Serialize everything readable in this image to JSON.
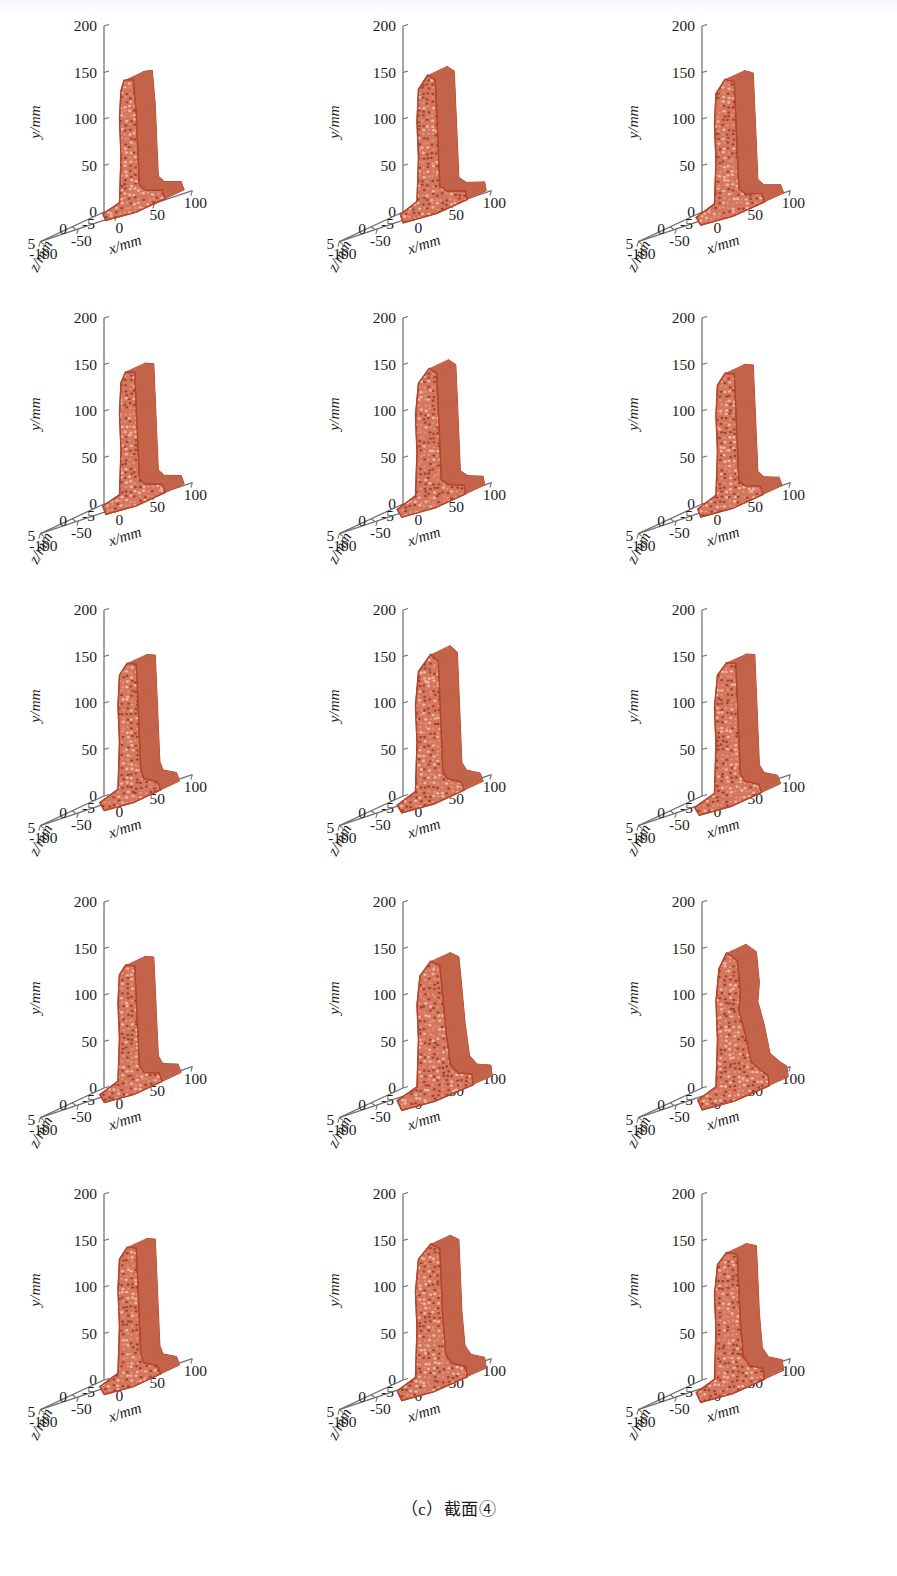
{
  "figure": {
    "caption": "（c）截面④",
    "caption_label": "(c)",
    "caption_text": "截面④",
    "rows": 5,
    "cols": 3,
    "panel_count": 15
  },
  "axes": {
    "y": {
      "label": "y/mm",
      "ticks": [
        "200",
        "150",
        "100",
        "50",
        "0"
      ],
      "values": [
        200,
        150,
        100,
        50,
        0
      ],
      "range": [
        0,
        200
      ]
    },
    "z": {
      "label": "z/mm",
      "ticks": [
        "-5",
        "0",
        "5"
      ],
      "values": [
        -5,
        0,
        5
      ],
      "range": [
        -5,
        5
      ]
    },
    "x": {
      "label": "x/mm",
      "ticks": [
        "-100",
        "-50",
        "0",
        "50",
        "100"
      ],
      "values": [
        -100,
        -50,
        0,
        50,
        100
      ],
      "range": [
        -100,
        100
      ]
    }
  },
  "style": {
    "mesh_fill": "#d4775e",
    "mesh_edge": "#b4452c",
    "mesh_speckle": "#8f3a22",
    "mesh_highlight": "#f0bfae",
    "axis_color": "#6f6f6f",
    "text_color": "#1d1d1d",
    "background": "#ffffff"
  },
  "chart_data": {
    "type": "scatter",
    "title": "",
    "subtitle": "",
    "xlabel": "x/mm",
    "ylabel": "y/mm",
    "zlabel": "z/mm",
    "xlim": [
      -100,
      100
    ],
    "ylim": [
      0,
      200
    ],
    "zlim": [
      -5,
      5
    ],
    "xticks": [
      -100,
      -50,
      0,
      50,
      100
    ],
    "yticks": [
      0,
      50,
      100,
      150,
      200
    ],
    "zticks": [
      -5,
      0,
      5
    ],
    "grid": false,
    "legend": "none",
    "projection": "3d",
    "panels": [
      {
        "index": 1,
        "row": 1,
        "col": 1,
        "series_name": "cross-section-1",
        "outline_xy": [
          [
            -20,
            140
          ],
          [
            -8,
            138
          ],
          [
            -4,
            100
          ],
          [
            -2,
            60
          ],
          [
            0,
            22
          ],
          [
            8,
            14
          ],
          [
            30,
            8
          ],
          [
            34,
            -2
          ],
          [
            -4,
            -6
          ],
          [
            -44,
            -4
          ],
          [
            -48,
            4
          ],
          [
            -26,
            10
          ],
          [
            -24,
            60
          ],
          [
            -26,
            100
          ],
          [
            -24,
            130
          ]
        ],
        "top_y": 140,
        "base_y": -6,
        "x_min": -48,
        "x_max": 34
      },
      {
        "index": 2,
        "row": 1,
        "col": 2,
        "series_name": "cross-section-2",
        "outline_xy": [
          [
            -14,
            144
          ],
          [
            -4,
            136
          ],
          [
            -2,
            98
          ],
          [
            0,
            58
          ],
          [
            2,
            20
          ],
          [
            12,
            12
          ],
          [
            36,
            6
          ],
          [
            38,
            -4
          ],
          [
            -2,
            -8
          ],
          [
            -46,
            -6
          ],
          [
            -50,
            4
          ],
          [
            -28,
            12
          ],
          [
            -26,
            58
          ],
          [
            -28,
            98
          ],
          [
            -26,
            132
          ]
        ],
        "top_y": 144,
        "base_y": -8,
        "x_min": -50,
        "x_max": 38
      },
      {
        "index": 3,
        "row": 1,
        "col": 3,
        "series_name": "cross-section-3",
        "outline_xy": [
          [
            -16,
            140
          ],
          [
            -4,
            134
          ],
          [
            -2,
            96
          ],
          [
            0,
            56
          ],
          [
            2,
            18
          ],
          [
            10,
            10
          ],
          [
            32,
            4
          ],
          [
            36,
            -6
          ],
          [
            -6,
            -10
          ],
          [
            -48,
            -8
          ],
          [
            -54,
            2
          ],
          [
            -30,
            10
          ],
          [
            -28,
            56
          ],
          [
            -30,
            96
          ],
          [
            -28,
            128
          ]
        ],
        "top_y": 140,
        "base_y": -10,
        "x_min": -54,
        "x_max": 36
      },
      {
        "index": 4,
        "row": 2,
        "col": 1,
        "series_name": "cross-section-4",
        "outline_xy": [
          [
            -18,
            140
          ],
          [
            -6,
            136
          ],
          [
            -4,
            98
          ],
          [
            -2,
            58
          ],
          [
            0,
            20
          ],
          [
            8,
            12
          ],
          [
            30,
            6
          ],
          [
            34,
            -4
          ],
          [
            -4,
            -8
          ],
          [
            -44,
            -6
          ],
          [
            -48,
            4
          ],
          [
            -26,
            10
          ],
          [
            -24,
            58
          ],
          [
            -26,
            98
          ],
          [
            -24,
            130
          ]
        ],
        "top_y": 140,
        "base_y": -8,
        "x_min": -48,
        "x_max": 34
      },
      {
        "index": 5,
        "row": 2,
        "col": 2,
        "series_name": "cross-section-5",
        "outline_xy": [
          [
            -12,
            142
          ],
          [
            -2,
            134
          ],
          [
            0,
            96
          ],
          [
            2,
            56
          ],
          [
            4,
            18
          ],
          [
            14,
            10
          ],
          [
            34,
            4
          ],
          [
            36,
            -6
          ],
          [
            -4,
            -10
          ],
          [
            -48,
            -8
          ],
          [
            -54,
            2
          ],
          [
            -30,
            10
          ],
          [
            -28,
            56
          ],
          [
            -30,
            96
          ],
          [
            -26,
            130
          ]
        ],
        "top_y": 142,
        "base_y": -10,
        "x_min": -54,
        "x_max": 36
      },
      {
        "index": 6,
        "row": 2,
        "col": 3,
        "series_name": "cross-section-6",
        "outline_xy": [
          [
            -16,
            138
          ],
          [
            -4,
            134
          ],
          [
            -2,
            96
          ],
          [
            0,
            56
          ],
          [
            2,
            18
          ],
          [
            10,
            10
          ],
          [
            30,
            4
          ],
          [
            34,
            -6
          ],
          [
            -6,
            -10
          ],
          [
            -48,
            -8
          ],
          [
            -52,
            2
          ],
          [
            -28,
            10
          ],
          [
            -26,
            56
          ],
          [
            -28,
            96
          ],
          [
            -26,
            128
          ]
        ],
        "top_y": 138,
        "base_y": -10,
        "x_min": -52,
        "x_max": 34
      },
      {
        "index": 7,
        "row": 3,
        "col": 1,
        "series_name": "cross-section-7",
        "outline_xy": [
          [
            -16,
            140
          ],
          [
            -4,
            136
          ],
          [
            -2,
            98
          ],
          [
            0,
            58
          ],
          [
            2,
            20
          ],
          [
            6,
            10
          ],
          [
            24,
            2
          ],
          [
            28,
            -8
          ],
          [
            -8,
            -12
          ],
          [
            -46,
            -10
          ],
          [
            -52,
            0
          ],
          [
            -28,
            8
          ],
          [
            -26,
            58
          ],
          [
            -28,
            98
          ],
          [
            -26,
            130
          ]
        ],
        "top_y": 140,
        "base_y": -12,
        "x_min": -52,
        "x_max": 28
      },
      {
        "index": 8,
        "row": 3,
        "col": 2,
        "series_name": "cross-section-8",
        "outline_xy": [
          [
            -10,
            148
          ],
          [
            0,
            138
          ],
          [
            2,
            98
          ],
          [
            4,
            58
          ],
          [
            6,
            18
          ],
          [
            12,
            8
          ],
          [
            30,
            0
          ],
          [
            34,
            -10
          ],
          [
            -6,
            -14
          ],
          [
            -48,
            -12
          ],
          [
            -54,
            -2
          ],
          [
            -30,
            6
          ],
          [
            -28,
            58
          ],
          [
            -30,
            98
          ],
          [
            -26,
            134
          ]
        ],
        "top_y": 148,
        "base_y": -14,
        "x_min": -54,
        "x_max": 34
      },
      {
        "index": 9,
        "row": 3,
        "col": 3,
        "series_name": "cross-section-9",
        "outline_xy": [
          [
            -14,
            140
          ],
          [
            -2,
            136
          ],
          [
            0,
            96
          ],
          [
            2,
            56
          ],
          [
            4,
            16
          ],
          [
            10,
            6
          ],
          [
            28,
            -2
          ],
          [
            32,
            -12
          ],
          [
            -8,
            -16
          ],
          [
            -50,
            -14
          ],
          [
            -56,
            -4
          ],
          [
            -30,
            4
          ],
          [
            -28,
            56
          ],
          [
            -30,
            96
          ],
          [
            -26,
            130
          ]
        ],
        "top_y": 140,
        "base_y": -16,
        "x_min": -56,
        "x_max": 32
      },
      {
        "index": 10,
        "row": 4,
        "col": 1,
        "series_name": "cross-section-10",
        "outline_xy": [
          [
            -18,
            130
          ],
          [
            -6,
            126
          ],
          [
            -4,
            92
          ],
          [
            -2,
            54
          ],
          [
            0,
            18
          ],
          [
            6,
            8
          ],
          [
            26,
            2
          ],
          [
            30,
            -8
          ],
          [
            -6,
            -12
          ],
          [
            -46,
            -10
          ],
          [
            -52,
            0
          ],
          [
            -28,
            8
          ],
          [
            -26,
            54
          ],
          [
            -28,
            92
          ],
          [
            -26,
            122
          ]
        ],
        "top_y": 130,
        "base_y": -12,
        "x_min": -52,
        "x_max": 30
      },
      {
        "index": 11,
        "row": 4,
        "col": 2,
        "series_name": "cross-section-11",
        "outline_xy": [
          [
            -10,
            132
          ],
          [
            2,
            124
          ],
          [
            6,
            90
          ],
          [
            10,
            52
          ],
          [
            16,
            14
          ],
          [
            26,
            2
          ],
          [
            44,
            -4
          ],
          [
            46,
            -16
          ],
          [
            -4,
            -20
          ],
          [
            -48,
            -18
          ],
          [
            -54,
            -6
          ],
          [
            -28,
            2
          ],
          [
            -26,
            52
          ],
          [
            -28,
            90
          ],
          [
            -24,
            120
          ]
        ],
        "top_y": 132,
        "base_y": -20,
        "x_min": -54,
        "x_max": 46
      },
      {
        "index": 12,
        "row": 4,
        "col": 3,
        "series_name": "cross-section-12",
        "outline_xy": [
          [
            -14,
            142
          ],
          [
            0,
            130
          ],
          [
            4,
            96
          ],
          [
            2,
            76
          ],
          [
            10,
            50
          ],
          [
            18,
            16
          ],
          [
            30,
            4
          ],
          [
            40,
            -4
          ],
          [
            42,
            -16
          ],
          [
            -4,
            -20
          ],
          [
            -46,
            -18
          ],
          [
            -52,
            -6
          ],
          [
            -28,
            2
          ],
          [
            -26,
            52
          ],
          [
            -28,
            94
          ],
          [
            -24,
            128
          ]
        ],
        "top_y": 142,
        "base_y": -20,
        "x_min": -52,
        "x_max": 42
      },
      {
        "index": 13,
        "row": 5,
        "col": 1,
        "series_name": "cross-section-13",
        "outline_xy": [
          [
            -16,
            140
          ],
          [
            -4,
            136
          ],
          [
            -2,
            98
          ],
          [
            0,
            58
          ],
          [
            2,
            20
          ],
          [
            6,
            10
          ],
          [
            24,
            2
          ],
          [
            28,
            -8
          ],
          [
            -8,
            -12
          ],
          [
            -46,
            -10
          ],
          [
            -52,
            0
          ],
          [
            -28,
            8
          ],
          [
            -26,
            58
          ],
          [
            -28,
            98
          ],
          [
            -26,
            130
          ]
        ],
        "top_y": 140,
        "base_y": -12,
        "x_min": -52,
        "x_max": 28
      },
      {
        "index": 14,
        "row": 5,
        "col": 2,
        "series_name": "cross-section-14",
        "outline_xy": [
          [
            -10,
            142
          ],
          [
            2,
            134
          ],
          [
            4,
            96
          ],
          [
            6,
            56
          ],
          [
            10,
            18
          ],
          [
            18,
            6
          ],
          [
            36,
            -2
          ],
          [
            38,
            -14
          ],
          [
            -6,
            -18
          ],
          [
            -48,
            -16
          ],
          [
            -54,
            -4
          ],
          [
            -30,
            4
          ],
          [
            -28,
            56
          ],
          [
            -30,
            96
          ],
          [
            -26,
            130
          ]
        ],
        "top_y": 142,
        "base_y": -18,
        "x_min": -54,
        "x_max": 38
      },
      {
        "index": 15,
        "row": 5,
        "col": 3,
        "series_name": "cross-section-15",
        "outline_xy": [
          [
            -14,
            134
          ],
          [
            0,
            128
          ],
          [
            2,
            92
          ],
          [
            4,
            54
          ],
          [
            8,
            16
          ],
          [
            16,
            4
          ],
          [
            34,
            -4
          ],
          [
            36,
            -16
          ],
          [
            -6,
            -20
          ],
          [
            -48,
            -18
          ],
          [
            -54,
            -6
          ],
          [
            -30,
            2
          ],
          [
            -28,
            54
          ],
          [
            -30,
            92
          ],
          [
            -26,
            124
          ]
        ],
        "top_y": 134,
        "base_y": -20,
        "x_min": -54,
        "x_max": 36
      }
    ]
  }
}
